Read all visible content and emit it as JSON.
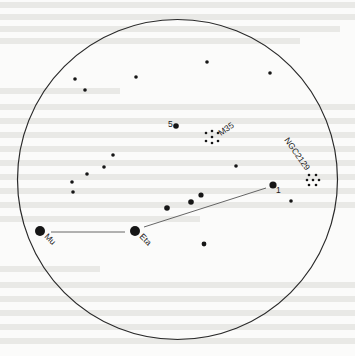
{
  "chart": {
    "field_circle": {
      "cx": 177.5,
      "cy": 179.5,
      "r": 160,
      "stroke": "#2a2a2a"
    },
    "star_color": "#161616",
    "line_color": "#555555",
    "stars": [
      {
        "x": 75,
        "y": 79,
        "r": 1.8
      },
      {
        "x": 85,
        "y": 90,
        "r": 1.8
      },
      {
        "x": 136,
        "y": 77,
        "r": 1.8
      },
      {
        "x": 207,
        "y": 62,
        "r": 1.8
      },
      {
        "x": 270,
        "y": 73,
        "r": 1.8
      },
      {
        "x": 113,
        "y": 155,
        "r": 1.8
      },
      {
        "x": 104,
        "y": 167,
        "r": 1.8
      },
      {
        "x": 87,
        "y": 174,
        "r": 1.8
      },
      {
        "x": 72,
        "y": 182,
        "r": 1.8
      },
      {
        "x": 73,
        "y": 192,
        "r": 1.8
      },
      {
        "x": 236,
        "y": 166,
        "r": 1.8
      },
      {
        "x": 291,
        "y": 201,
        "r": 1.8
      },
      {
        "x": 204,
        "y": 244,
        "r": 2.4
      },
      {
        "x": 167,
        "y": 208,
        "r": 2.8
      },
      {
        "x": 191,
        "y": 202,
        "r": 2.8
      },
      {
        "x": 201,
        "y": 195,
        "r": 2.6
      }
    ],
    "named_stars": [
      {
        "id": "star-5",
        "label": "5",
        "x": 176,
        "y": 126,
        "r": 2.8,
        "label_dx": -8,
        "label_dy": 1,
        "rotate": 0
      },
      {
        "id": "star-1",
        "label": "1",
        "x": 273,
        "y": 185,
        "r": 3.6,
        "label_dx": 3,
        "label_dy": 8,
        "rotate": 0
      },
      {
        "id": "star-eta",
        "label": "Eta",
        "x": 135,
        "y": 231,
        "r": 5,
        "label_dx": 4,
        "label_dy": 6,
        "rotate": 45
      },
      {
        "id": "star-mu",
        "label": "Mu",
        "x": 40,
        "y": 231,
        "r": 5,
        "label_dx": 4,
        "label_dy": 6,
        "rotate": 45
      }
    ],
    "lines": [
      {
        "from": "star-mu",
        "x1": 51,
        "y1": 232,
        "x2": 125,
        "y2": 232
      },
      {
        "from": "star-eta",
        "x1": 144,
        "y1": 227,
        "x2": 266,
        "y2": 188
      }
    ],
    "clusters": [
      {
        "id": "m35",
        "label": "M35",
        "cx": 212,
        "cy": 137,
        "label_x": 221,
        "label_y": 136,
        "rotate": -35,
        "dots": [
          [
            -6,
            -4
          ],
          [
            0,
            -6
          ],
          [
            6,
            -4
          ],
          [
            -6,
            4
          ],
          [
            0,
            6
          ],
          [
            6,
            4
          ],
          [
            0,
            0
          ]
        ]
      },
      {
        "id": "ngc2129",
        "label": "NGC2129",
        "cx": 313,
        "cy": 180,
        "label_x": 284,
        "label_y": 140,
        "rotate": 55,
        "dots": [
          [
            -4,
            -5
          ],
          [
            3,
            -5
          ],
          [
            -6,
            0
          ],
          [
            6,
            0
          ],
          [
            -4,
            5
          ],
          [
            3,
            5
          ],
          [
            0,
            0
          ]
        ]
      }
    ]
  }
}
